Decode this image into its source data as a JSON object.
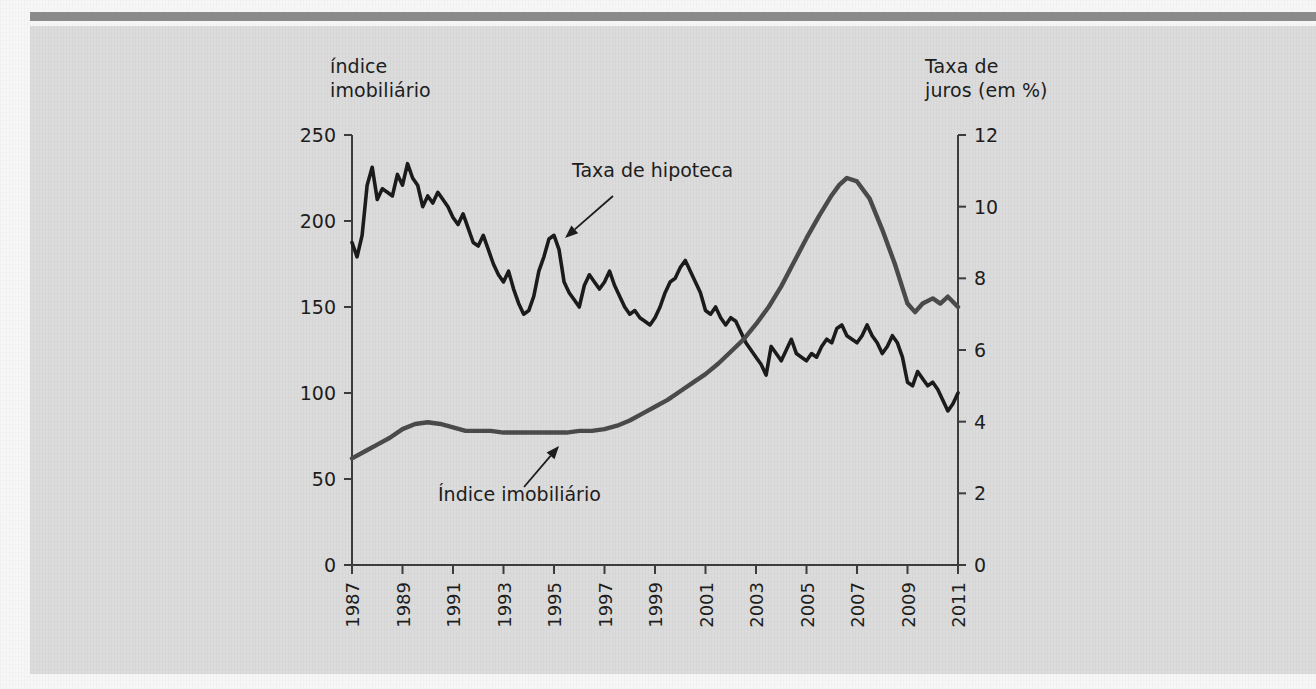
{
  "figure": {
    "background_color": "#dcdcdc",
    "page_color": "#f7f7f7",
    "rule_color": "#8b8b8b"
  },
  "left_axis_caption": "índice\nimobiliário",
  "right_axis_caption": "Taxa de\njuros (em %)",
  "annotations": [
    {
      "name": "mortgage-rate",
      "text": "Taxa de hipoteca"
    },
    {
      "name": "housing-index",
      "text": "Índice imobiliário"
    }
  ],
  "chart_data": {
    "type": "line",
    "title": "",
    "xlabel": "",
    "ylabel": "índice imobiliário",
    "y2label": "Taxa de juros (em %)",
    "grid": false,
    "legend": "annotations",
    "xlim": [
      1987,
      2011
    ],
    "ylim": [
      0,
      250
    ],
    "y2lim": [
      0,
      12
    ],
    "xticks": [
      1987,
      1989,
      1991,
      1993,
      1995,
      1997,
      1999,
      2001,
      2003,
      2005,
      2007,
      2009,
      2011
    ],
    "xtick_labels": [
      "1987",
      "1989",
      "1991",
      "1993",
      "1995",
      "1997",
      "1999",
      "2001",
      "2003",
      "2005",
      "2007",
      "2009",
      "2011"
    ],
    "yticks": [
      0,
      50,
      100,
      150,
      200,
      250
    ],
    "ytick_labels": [
      "0",
      "50",
      "100",
      "150",
      "200",
      "250"
    ],
    "y2ticks": [
      0,
      2,
      4,
      6,
      8,
      10,
      12
    ],
    "y2tick_labels": [
      "0",
      "2",
      "4",
      "6",
      "8",
      "10",
      "12"
    ],
    "series": [
      {
        "name": "Taxa de hipoteca",
        "axis": "right",
        "units": "%",
        "color": "#1b1b1b",
        "x": [
          1987.0,
          1987.2,
          1987.4,
          1987.6,
          1987.8,
          1988.0,
          1988.2,
          1988.4,
          1988.6,
          1988.8,
          1989.0,
          1989.2,
          1989.4,
          1989.6,
          1989.8,
          1990.0,
          1990.2,
          1990.4,
          1990.6,
          1990.8,
          1991.0,
          1991.2,
          1991.4,
          1991.6,
          1991.8,
          1992.0,
          1992.2,
          1992.4,
          1992.6,
          1992.8,
          1993.0,
          1993.2,
          1993.4,
          1993.6,
          1993.8,
          1994.0,
          1994.2,
          1994.4,
          1994.6,
          1994.8,
          1995.0,
          1995.2,
          1995.4,
          1995.6,
          1995.8,
          1996.0,
          1996.2,
          1996.4,
          1996.6,
          1996.8,
          1997.0,
          1997.2,
          1997.4,
          1997.6,
          1997.8,
          1998.0,
          1998.2,
          1998.4,
          1998.6,
          1998.8,
          1999.0,
          1999.2,
          1999.4,
          1999.6,
          1999.8,
          2000.0,
          2000.2,
          2000.4,
          2000.6,
          2000.8,
          2001.0,
          2001.2,
          2001.4,
          2001.6,
          2001.8,
          2002.0,
          2002.2,
          2002.4,
          2002.6,
          2002.8,
          2003.0,
          2003.2,
          2003.4,
          2003.6,
          2003.8,
          2004.0,
          2004.2,
          2004.4,
          2004.6,
          2004.8,
          2005.0,
          2005.2,
          2005.4,
          2005.6,
          2005.8,
          2006.0,
          2006.2,
          2006.4,
          2006.6,
          2006.8,
          2007.0,
          2007.2,
          2007.4,
          2007.6,
          2007.8,
          2008.0,
          2008.2,
          2008.4,
          2008.6,
          2008.8,
          2009.0,
          2009.2,
          2009.4,
          2009.6,
          2009.8,
          2010.0,
          2010.2,
          2010.4,
          2010.6,
          2010.8,
          2011.0
        ],
        "values": [
          9.0,
          8.6,
          9.2,
          10.6,
          11.1,
          10.2,
          10.5,
          10.4,
          10.3,
          10.9,
          10.6,
          11.2,
          10.8,
          10.6,
          10.0,
          10.3,
          10.1,
          10.4,
          10.2,
          10.0,
          9.7,
          9.5,
          9.8,
          9.4,
          9.0,
          8.9,
          9.2,
          8.8,
          8.4,
          8.1,
          7.9,
          8.2,
          7.7,
          7.3,
          7.0,
          7.1,
          7.5,
          8.2,
          8.6,
          9.1,
          9.2,
          8.8,
          7.9,
          7.6,
          7.4,
          7.2,
          7.8,
          8.1,
          7.9,
          7.7,
          7.9,
          8.2,
          7.8,
          7.5,
          7.2,
          7.0,
          7.1,
          6.9,
          6.8,
          6.7,
          6.9,
          7.2,
          7.6,
          7.9,
          8.0,
          8.3,
          8.5,
          8.2,
          7.9,
          7.6,
          7.1,
          7.0,
          7.2,
          6.9,
          6.7,
          6.9,
          6.8,
          6.5,
          6.2,
          6.0,
          5.8,
          5.6,
          5.3,
          6.1,
          5.9,
          5.7,
          6.0,
          6.3,
          5.9,
          5.8,
          5.7,
          5.9,
          5.8,
          6.1,
          6.3,
          6.2,
          6.6,
          6.7,
          6.4,
          6.3,
          6.2,
          6.4,
          6.7,
          6.4,
          6.2,
          5.9,
          6.1,
          6.4,
          6.2,
          5.8,
          5.1,
          5.0,
          5.4,
          5.2,
          5.0,
          5.1,
          4.9,
          4.6,
          4.3,
          4.5,
          4.8
        ]
      },
      {
        "name": "Índice imobiliário",
        "axis": "left",
        "units": "index",
        "color": "#4a4a4a",
        "x": [
          1987.0,
          1987.5,
          1988.0,
          1988.5,
          1989.0,
          1989.5,
          1990.0,
          1990.5,
          1991.0,
          1991.5,
          1992.0,
          1992.5,
          1993.0,
          1993.5,
          1994.0,
          1994.5,
          1995.0,
          1995.5,
          1996.0,
          1996.5,
          1997.0,
          1997.5,
          1998.0,
          1998.5,
          1999.0,
          1999.5,
          2000.0,
          2000.5,
          2001.0,
          2001.5,
          2002.0,
          2002.5,
          2003.0,
          2003.5,
          2004.0,
          2004.5,
          2005.0,
          2005.5,
          2006.0,
          2006.3,
          2006.6,
          2007.0,
          2007.5,
          2008.0,
          2008.5,
          2009.0,
          2009.3,
          2009.6,
          2010.0,
          2010.3,
          2010.6,
          2011.0
        ],
        "values": [
          62,
          66,
          70,
          74,
          79,
          82,
          83,
          82,
          80,
          78,
          78,
          78,
          77,
          77,
          77,
          77,
          77,
          77,
          78,
          78,
          79,
          81,
          84,
          88,
          92,
          96,
          101,
          106,
          111,
          117,
          124,
          131,
          140,
          150,
          162,
          176,
          190,
          203,
          215,
          221,
          225,
          223,
          213,
          195,
          175,
          152,
          147,
          152,
          155,
          152,
          156,
          150
        ]
      }
    ]
  }
}
